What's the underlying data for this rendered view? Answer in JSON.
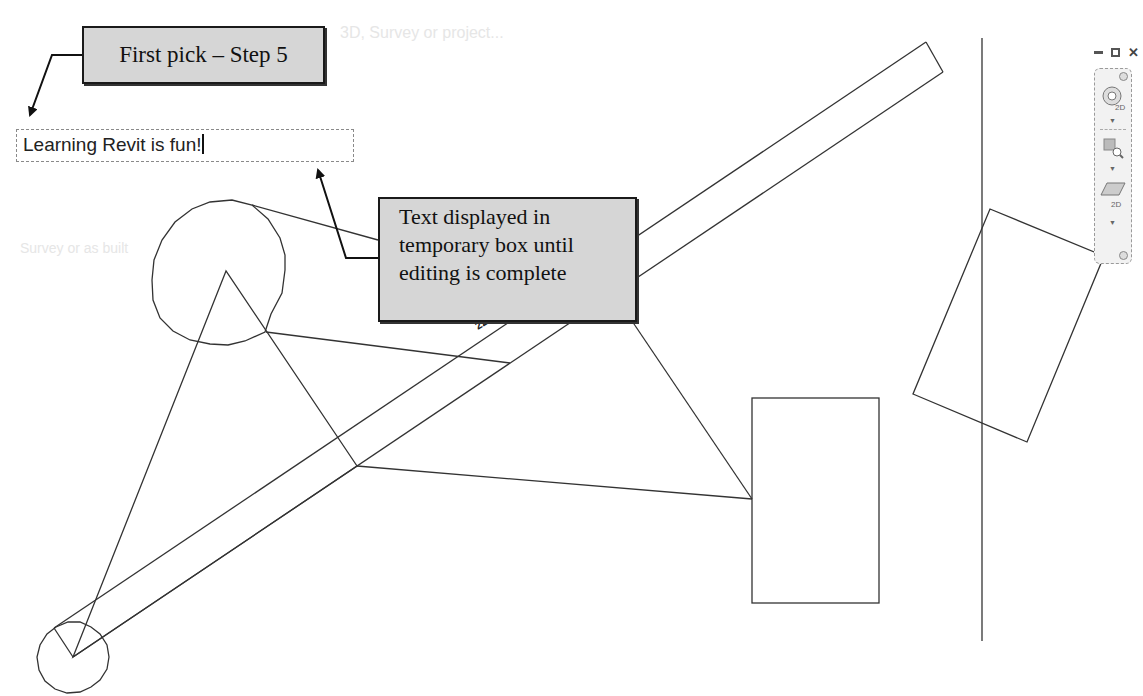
{
  "background_text": {
    "top_label": "3D, Survey or project...",
    "side_label": "Survey or as built"
  },
  "callouts": {
    "first_pick": "First pick – Step 5",
    "temp_box_lines": [
      "Text displayed in",
      "temporary box until",
      "editing is complete"
    ]
  },
  "text_editor": {
    "value": "Learning Revit is fun!"
  },
  "window_controls": {
    "minimize": "minimize-icon",
    "restore": "restore-icon",
    "close": "close-icon"
  },
  "navigation_bar": {
    "items": [
      {
        "icon": "steering-wheel-2d-icon",
        "label": "2D"
      },
      {
        "icon": "zoom-region-icon",
        "label": ""
      },
      {
        "icon": "pan-2d-icon",
        "label": "2D"
      }
    ]
  },
  "dimension_label": "22.6",
  "colors": {
    "callout_fill": "#d6d6d6",
    "callout_border": "#1a1a1a",
    "line": "#333333",
    "background": "#ffffff"
  }
}
